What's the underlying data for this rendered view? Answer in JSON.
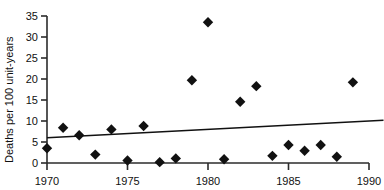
{
  "chart_data": {
    "type": "scatter",
    "title": "",
    "subtitle": "",
    "xlabel": "",
    "ylabel": "Deaths per 100 unit-years",
    "xlim": [
      1970,
      1990
    ],
    "ylim": [
      0,
      35
    ],
    "xticks": [
      1970,
      1975,
      1980,
      1985,
      1990
    ],
    "xtick_labels": [
      "1970",
      "1975",
      "1980",
      "1985",
      "1990"
    ],
    "yticks": [
      0,
      5,
      10,
      15,
      20,
      25,
      30,
      35
    ],
    "ytick_labels": [
      "0",
      "5",
      "10",
      "15",
      "20",
      "25",
      "30",
      "35"
    ],
    "grid": false,
    "legend": null,
    "marker": "diamond",
    "marker_color": "#111111",
    "x": [
      1970,
      1971,
      1972,
      1973,
      1974,
      1975,
      1976,
      1977,
      1978,
      1979,
      1980,
      1981,
      1982,
      1983,
      1984,
      1985,
      1986,
      1987,
      1988,
      1989
    ],
    "y": [
      3.5,
      8.4,
      6.6,
      2.0,
      8.0,
      0.6,
      8.8,
      0.2,
      1.1,
      19.7,
      33.5,
      0.9,
      14.6,
      18.3,
      1.7,
      4.3,
      2.9,
      4.3,
      1.5,
      19.2
    ],
    "series": [
      {
        "name": "Deaths per 100 unit-years",
        "type": "scatter",
        "points": [
          {
            "x": 1970,
            "y": 3.5
          },
          {
            "x": 1971,
            "y": 8.4
          },
          {
            "x": 1972,
            "y": 6.6
          },
          {
            "x": 1973,
            "y": 2.0
          },
          {
            "x": 1974,
            "y": 8.0
          },
          {
            "x": 1975,
            "y": 0.6
          },
          {
            "x": 1976,
            "y": 8.8
          },
          {
            "x": 1977,
            "y": 0.2
          },
          {
            "x": 1978,
            "y": 1.1
          },
          {
            "x": 1979,
            "y": 19.7
          },
          {
            "x": 1980,
            "y": 33.5
          },
          {
            "x": 1981,
            "y": 0.9
          },
          {
            "x": 1982,
            "y": 14.6
          },
          {
            "x": 1983,
            "y": 18.3
          },
          {
            "x": 1984,
            "y": 1.7
          },
          {
            "x": 1985,
            "y": 4.3
          },
          {
            "x": 1986,
            "y": 2.9
          },
          {
            "x": 1987,
            "y": 4.3
          },
          {
            "x": 1988,
            "y": 1.5
          },
          {
            "x": 1989,
            "y": 19.2
          }
        ]
      },
      {
        "name": "trend-line",
        "type": "line",
        "points": [
          {
            "x": 1970,
            "y": 6.0
          },
          {
            "x": 1990.9,
            "y": 10.2
          }
        ]
      }
    ],
    "annotations": [],
    "colors": {
      "axis": "#2b2b2b",
      "marker": "#111111",
      "trend": "#111111",
      "background": "#ffffff",
      "text": "#111111"
    }
  }
}
